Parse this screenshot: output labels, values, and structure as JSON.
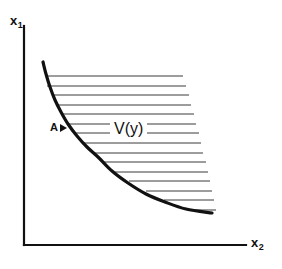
{
  "figure": {
    "kind": "isoquant-input-requirement-set",
    "background_color": "#ffffff",
    "ink_color": "#111111",
    "width": 282,
    "height": 269
  },
  "axes": {
    "y_axis_label": "x",
    "y_axis_subscript": "1",
    "x_axis_label": "x",
    "x_axis_subscript": "2",
    "origin": [
      24,
      245
    ],
    "y_axis_top": [
      24,
      26
    ],
    "x_axis_right": [
      246,
      245
    ],
    "line_width": 2.2
  },
  "labels": {
    "region": "V(y)",
    "point": "A"
  },
  "chart_data": {
    "type": "line",
    "title": "",
    "xlabel": "x2",
    "ylabel": "x1",
    "grid": false,
    "legend": null,
    "annotations": [
      {
        "text": "V(y)",
        "x": 110,
        "y": 128,
        "note": "input requirement set, hatched region above isoquant"
      },
      {
        "text": "A",
        "x": 52,
        "y": 128,
        "note": "point on the isoquant boundary"
      }
    ],
    "series": [
      {
        "name": "isoquant",
        "kind": "curve",
        "stroke": "#111111",
        "stroke_width": 3.2,
        "points": [
          [
            43,
            62
          ],
          [
            46,
            74
          ],
          [
            50,
            87
          ],
          [
            55,
            100
          ],
          [
            61,
            112
          ],
          [
            68,
            124
          ],
          [
            77,
            136
          ],
          [
            87,
            147
          ],
          [
            99,
            158
          ],
          [
            112,
            171
          ],
          [
            128,
            183
          ],
          [
            146,
            194
          ],
          [
            165,
            202
          ],
          [
            186,
            209
          ],
          [
            212,
            213
          ]
        ]
      }
    ],
    "hatching": {
      "orientation": "horizontal",
      "count": 15,
      "stroke": "#3a3a3a",
      "stroke_width": 1.0,
      "y_start": 76,
      "y_step": 9.6,
      "lines": [
        {
          "y": 76,
          "x_left": 45,
          "x_right": 183
        },
        {
          "y": 86,
          "x_left": 47,
          "x_right": 186
        },
        {
          "y": 95,
          "x_left": 52,
          "x_right": 189
        },
        {
          "y": 105,
          "x_left": 56,
          "x_right": 191
        },
        {
          "y": 114,
          "x_left": 62,
          "x_right": 194
        },
        {
          "y": 124,
          "x_left": 68,
          "x_right": 196
        },
        {
          "y": 133,
          "x_left": 75,
          "x_right": 199
        },
        {
          "y": 143,
          "x_left": 83,
          "x_right": 201
        },
        {
          "y": 153,
          "x_left": 92,
          "x_right": 203
        },
        {
          "y": 162,
          "x_left": 103,
          "x_right": 206
        },
        {
          "y": 172,
          "x_left": 115,
          "x_right": 208
        },
        {
          "y": 181,
          "x_left": 129,
          "x_right": 210
        },
        {
          "y": 191,
          "x_left": 146,
          "x_right": 212
        },
        {
          "y": 200,
          "x_left": 164,
          "x_right": 214
        },
        {
          "y": 210,
          "x_left": 190,
          "x_right": 216
        }
      ]
    }
  }
}
